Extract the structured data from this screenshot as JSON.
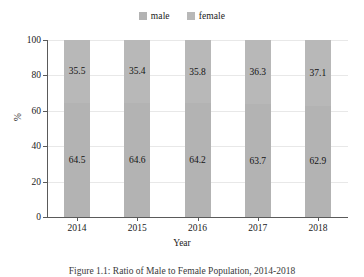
{
  "chart_data": {
    "type": "bar",
    "subtype": "stacked-100-percent",
    "title": "",
    "xlabel": "Year",
    "ylabel": "%",
    "categories": [
      "2014",
      "2015",
      "2016",
      "2017",
      "2018"
    ],
    "series": [
      {
        "name": "male",
        "values": [
          64.5,
          64.6,
          64.2,
          63.7,
          62.9
        ],
        "color": "#b3b3b3"
      },
      {
        "name": "female",
        "values": [
          35.5,
          35.4,
          35.8,
          36.3,
          37.1
        ],
        "color": "#b8b8b8"
      }
    ],
    "ylim": [
      0,
      100
    ],
    "yticks": [
      0,
      20,
      40,
      60,
      80,
      100
    ],
    "ytick_labels": [
      "0",
      "20",
      "40",
      "60",
      "80",
      "100"
    ],
    "grid": true,
    "grid_axis": "y",
    "legend_position": "top-center",
    "value_labels": true,
    "value_label_format": "one-decimal"
  },
  "legend": {
    "entries": [
      {
        "label": "male",
        "color": "#b3b3b3"
      },
      {
        "label": "female",
        "color": "#b8b8b8"
      }
    ]
  },
  "axes": {
    "x_title": "Year",
    "y_title": "%"
  },
  "caption": {
    "text": "Figure 1.1:  Ratio of Male to Female Population, 2014-2018"
  },
  "colors": {
    "bar_male": "#b3b3b3",
    "bar_female": "#b8b8b8",
    "gridline": "#e8e8e8",
    "axis": "#5a5a5a",
    "text": "#1a1a1a",
    "background": "#ffffff"
  }
}
